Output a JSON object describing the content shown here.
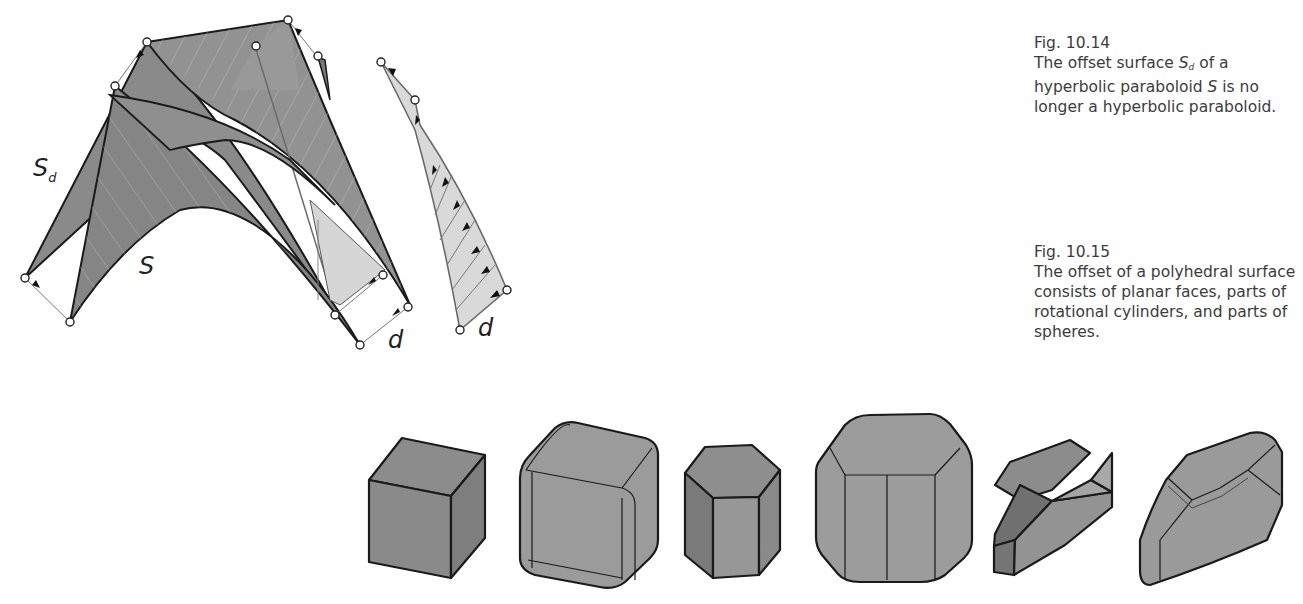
{
  "figures": [
    {
      "id": "fig-10-14",
      "number": "Fig. 10.14",
      "caption_parts": [
        "The offset surface ",
        "S",
        "d",
        " of a hyperbolic paraboloid ",
        "S",
        " is no longer a hyperbolic paraboloid."
      ],
      "labels": {
        "offset_surface": "S",
        "offset_subscript": "d",
        "surface": "S",
        "distance_left": "d",
        "distance_right": "d"
      }
    },
    {
      "id": "fig-10-15",
      "number": "Fig. 10.15",
      "caption": "The offset of a polyhedral surface consists of planar faces, parts of rotational cylinders, and parts of spheres.",
      "solids": [
        "cube",
        "cube-offset",
        "hexagonal-prism",
        "hexagonal-prism-offset",
        "polyhedron",
        "polyhedron-offset"
      ]
    }
  ],
  "colors": {
    "surface_dark": "#7d7d7d",
    "surface_mid": "#8f8f8f",
    "surface_light": "#a8a8a8",
    "surface_pale": "#d6d6d6",
    "edge": "#1a1a1a",
    "text": "#3c3c3c"
  }
}
